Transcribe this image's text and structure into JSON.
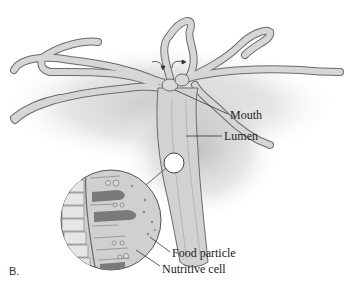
{
  "figure": {
    "panel_label": "B.",
    "labels": {
      "mouth": "Mouth",
      "lumen": "Lumen",
      "food_particle": "Food particle",
      "nutritive_cell": "Nutritive cell"
    },
    "colors": {
      "body_fill": "#d6d6d6",
      "outline": "#6a6a6a",
      "shadow": "#c9c9c9",
      "dark_cell": "#7a7a7a",
      "background": "#ffffff"
    }
  }
}
